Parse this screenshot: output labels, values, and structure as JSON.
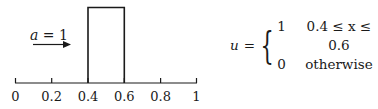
{
  "diagram": {
    "axis": {
      "tick_labels": [
        "0",
        "0.2",
        "0.4",
        "0.6",
        "0.8",
        "1"
      ],
      "ticks": [
        0,
        0.2,
        0.4,
        0.6,
        0.8,
        1.0
      ],
      "range": [
        0,
        1
      ]
    },
    "pulse": {
      "x_start": 0.4,
      "x_end": 0.6,
      "height": 1
    },
    "velocity_label": {
      "var": "a",
      "eq": " = ",
      "value": "1",
      "direction": "right-arrow"
    },
    "equation": {
      "lhs": "u",
      "eq": "=",
      "cases": [
        {
          "value": "1",
          "condition": "0.4 ≤ x ≤ 0.6"
        },
        {
          "value": "0",
          "condition": "otherwise"
        }
      ]
    },
    "colors": {
      "stroke": "#1a1a1a",
      "background": "#ffffff"
    }
  }
}
